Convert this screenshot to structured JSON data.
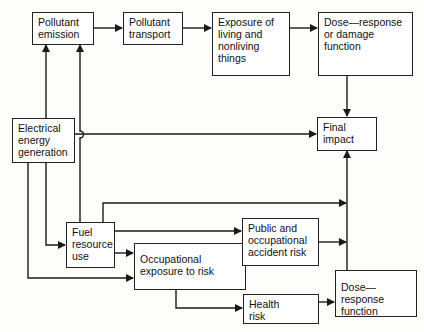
{
  "diagram": {
    "type": "flowchart",
    "nodes": {
      "pollutant_emission": "Pollutant\nemission",
      "pollutant_transport": "Pollutant\ntransport",
      "exposure": "Exposure of\nliving and\nnonliving\nthings",
      "dose_response_damage": "Dose—response\nor damage\nfunction",
      "electrical_energy_generation": "Electrical\nenergy\ngeneration",
      "final_impact": "Final\nimpact",
      "fuel_resource_use": "Fuel\nresource\nuse",
      "occupational_exposure": "Occupational\nexposure to risk",
      "public_occupational_accident_risk": "Public and\noccupational\naccident risk",
      "health_risk": "Health\nrisk",
      "dose_response_function": "Dose—response\nfunction"
    },
    "edges": [
      {
        "from": "Pollutant emission",
        "to": "Pollutant transport"
      },
      {
        "from": "Pollutant transport",
        "to": "Exposure of living and nonliving things"
      },
      {
        "from": "Exposure of living and nonliving things",
        "to": "Dose—response or damage function"
      },
      {
        "from": "Dose—response or damage function",
        "to": "Final impact"
      },
      {
        "from": "Electrical energy generation",
        "to": "Pollutant emission"
      },
      {
        "from": "Fuel resource use",
        "to": "Pollutant emission"
      },
      {
        "from": "Electrical energy generation",
        "to": "Final impact"
      },
      {
        "from": "Electrical energy generation",
        "to": "Fuel resource use"
      },
      {
        "from": "Electrical energy generation",
        "to": "Occupational exposure to risk"
      },
      {
        "from": "Fuel resource use",
        "to": "Final impact"
      },
      {
        "from": "Fuel resource use",
        "to": "Public and occupational accident risk"
      },
      {
        "from": "Fuel resource use",
        "to": "Occupational exposure to risk"
      },
      {
        "from": "Occupational exposure to risk",
        "to": "Public and occupational accident risk"
      },
      {
        "from": "Public and occupational accident risk",
        "to": "Final impact"
      },
      {
        "from": "Occupational exposure to risk",
        "to": "Health risk"
      },
      {
        "from": "Health risk",
        "to": "Dose—response function"
      },
      {
        "from": "Dose—response function",
        "to": "Final impact"
      }
    ],
    "colors": {
      "line": "#1a1a1a",
      "box_border": "#222222",
      "background": "#fdfdfb"
    }
  }
}
